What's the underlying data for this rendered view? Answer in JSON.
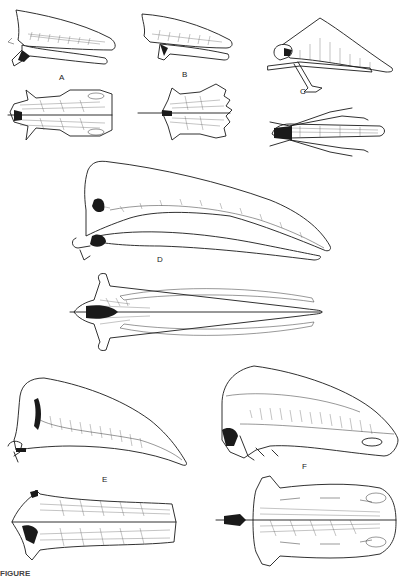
{
  "plate": {
    "type": "scientific-illustration",
    "subject": "sterna (breastbones), lateral and ventral views",
    "background": "#ffffff",
    "ink_color": "#1a1a1a"
  },
  "figures": [
    {
      "id": "A",
      "label": "A",
      "views": [
        "lateral",
        "ventral"
      ]
    },
    {
      "id": "B",
      "label": "B",
      "views": [
        "lateral",
        "ventral"
      ]
    },
    {
      "id": "C",
      "label": "C",
      "views": [
        "lateral",
        "ventral"
      ]
    },
    {
      "id": "D",
      "label": "D",
      "views": [
        "lateral",
        "ventral"
      ]
    },
    {
      "id": "E",
      "label": "E",
      "views": [
        "lateral",
        "ventral"
      ]
    },
    {
      "id": "F",
      "label": "F",
      "views": [
        "lateral",
        "ventral"
      ]
    }
  ],
  "caption": {
    "text": "FIGURE",
    "truncated": true
  }
}
